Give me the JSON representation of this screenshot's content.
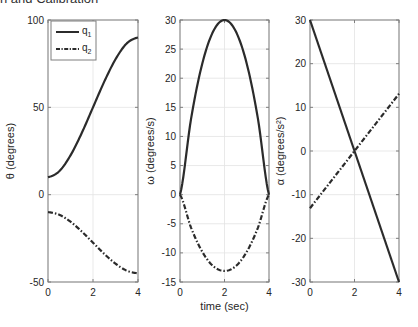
{
  "caption": "n and Calibration",
  "colors": {
    "axis": "#7f7f7f",
    "grid": "#e3e3e3",
    "line": "#2b2b2b",
    "text": "#262626"
  },
  "chart_data": [
    {
      "type": "line",
      "title": "",
      "xlabel": "",
      "ylabel": "θ (degrees)",
      "xlim": [
        0,
        4
      ],
      "ylim": [
        -50,
        100
      ],
      "xticks": [
        0,
        2,
        4
      ],
      "yticks": [
        -50,
        0,
        50,
        100
      ],
      "grid": true,
      "legend": {
        "position": "upper left",
        "entries": [
          "q1",
          "q2"
        ]
      },
      "x": [
        0,
        0.5,
        1,
        1.5,
        2,
        2.5,
        3,
        3.5,
        4
      ],
      "series": [
        {
          "name": "q1",
          "style": "solid",
          "values": [
            10,
            13.4,
            22.5,
            35.3,
            50,
            64.7,
            77.5,
            86.6,
            90
          ]
        },
        {
          "name": "q2",
          "style": "dashdot",
          "values": [
            -10,
            -11.5,
            -15.5,
            -21.1,
            -27.5,
            -33.9,
            -39.5,
            -43.5,
            -45
          ]
        }
      ]
    },
    {
      "type": "line",
      "title": "",
      "xlabel": "time (sec)",
      "ylabel": "ω (degrees/s)",
      "xlim": [
        0,
        4
      ],
      "ylim": [
        -15,
        30
      ],
      "xticks": [
        0,
        2,
        4
      ],
      "yticks": [
        -15,
        -10,
        -5,
        0,
        5,
        10,
        15,
        20,
        25,
        30
      ],
      "grid": true,
      "x": [
        0,
        0.5,
        1,
        1.5,
        2,
        2.5,
        3,
        3.5,
        4
      ],
      "series": [
        {
          "name": "q1",
          "style": "solid",
          "values": [
            0,
            13.1,
            22.5,
            28.1,
            30,
            28.1,
            22.5,
            13.1,
            0
          ]
        },
        {
          "name": "q2",
          "style": "dashdot",
          "values": [
            0,
            -5.7,
            -9.8,
            -12.3,
            -13.1,
            -12.3,
            -9.8,
            -5.7,
            0
          ]
        }
      ]
    },
    {
      "type": "line",
      "title": "",
      "xlabel": "",
      "ylabel": "α (degrees/s²)",
      "xlim": [
        0,
        4
      ],
      "ylim": [
        -30,
        30
      ],
      "xticks": [
        0,
        2,
        4
      ],
      "yticks": [
        -30,
        -20,
        -10,
        0,
        10,
        20,
        30
      ],
      "grid": true,
      "x": [
        0,
        4
      ],
      "series": [
        {
          "name": "q1",
          "style": "solid",
          "values": [
            30,
            -30
          ]
        },
        {
          "name": "q2",
          "style": "dashdot",
          "values": [
            -13.1,
            13.1
          ]
        }
      ]
    }
  ],
  "layout": {
    "axes": [
      {
        "left": 48,
        "top": 20,
        "right": 138,
        "bottom": 282
      },
      {
        "left": 180,
        "top": 20,
        "right": 269,
        "bottom": 282
      },
      {
        "left": 310,
        "top": 20,
        "right": 399,
        "bottom": 282
      }
    ]
  }
}
